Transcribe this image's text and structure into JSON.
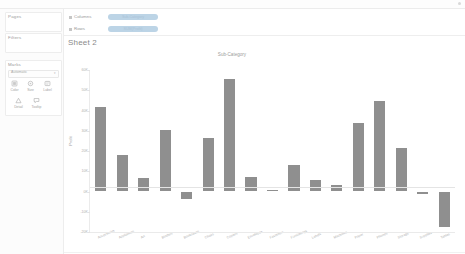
{
  "app": {
    "sheet_title": "Sheet 2"
  },
  "sidebar": {
    "pages_label": "Pages",
    "filters_label": "Filters",
    "marks_label": "Marks",
    "marks_type": "Automatic",
    "marks_type_caret": "▾",
    "buttons": [
      {
        "id": "color",
        "label": "Color",
        "icon": "color-icon"
      },
      {
        "id": "size",
        "label": "Size",
        "icon": "size-icon"
      },
      {
        "id": "label",
        "label": "Label",
        "icon": "label-icon"
      },
      {
        "id": "detail",
        "label": "Detail",
        "icon": "detail-icon"
      },
      {
        "id": "tooltip",
        "label": "Tooltip",
        "icon": "tooltip-icon"
      }
    ]
  },
  "shelves": {
    "columns_label": "Columns",
    "rows_label": "Rows",
    "columns_pill": "Sub-Category",
    "rows_pill": "SUM(Profit)"
  },
  "colors": {
    "bar": "#8f8f8f",
    "pill": "#bcd4e6",
    "axis": "#e4e4e4",
    "text": "#a6a6a6"
  },
  "chart_data": {
    "type": "bar",
    "title": "Sub-Category",
    "xlabel": "",
    "ylabel": "Profit",
    "grid": false,
    "legend": false,
    "ylim": [
      -20000,
      60000
    ],
    "yticks": [
      60000,
      50000,
      40000,
      30000,
      20000,
      10000,
      0,
      -10000,
      -20000
    ],
    "ytick_labels": [
      "60K",
      "50K",
      "40K",
      "30K",
      "20K",
      "10K",
      "0K",
      "-10K",
      "-20K"
    ],
    "categories": [
      "Accessories",
      "Appliances",
      "Art",
      "Binders",
      "Bookcases",
      "Chairs",
      "Copiers",
      "Envelopes",
      "Fasteners",
      "Furnishings",
      "Labels",
      "Machines",
      "Paper",
      "Phones",
      "Storage",
      "Supplies",
      "Tables"
    ],
    "values": [
      41937,
      18138,
      6528,
      30222,
      -3473,
      26590,
      55618,
      6964,
      950,
      13059,
      5546,
      3385,
      34054,
      44516,
      21279,
      -1189,
      -17725
    ]
  }
}
